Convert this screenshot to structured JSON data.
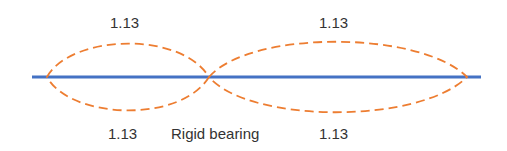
{
  "diagram": {
    "labels": {
      "top_left": "1.13",
      "top_right": "1.13",
      "bottom_left": "1.13",
      "bottom_right": "1.13",
      "bearing": "Rigid bearing"
    },
    "colors": {
      "beam": "#4472c4",
      "mode_shape": "#ed7d31",
      "text": "#333333"
    }
  }
}
